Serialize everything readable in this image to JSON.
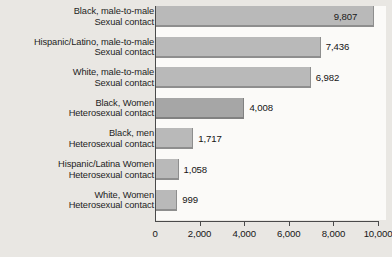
{
  "chart_data": {
    "type": "bar",
    "orientation": "horizontal",
    "title": "",
    "subtitle": "",
    "xlabel": "",
    "ylabel": "",
    "xlim": [
      0,
      10000
    ],
    "xticks": [
      0,
      2000,
      4000,
      6000,
      8000,
      10000
    ],
    "xtick_labels": [
      "0",
      "2,000",
      "4,000",
      "6,000",
      "8,000",
      "10,000"
    ],
    "grid": false,
    "legend": null,
    "categories": [
      "Black, male-to-male Sexual contact",
      "Hispanic/Latino, male-to-male Sexual contact",
      "White, male-to-male Sexual contact",
      "Black, Women Heterosexual contact",
      "Black, men Heterosexual contact",
      "Hispanic/Latina Women Heterosexual contact",
      "White, Women Heterosexual contact"
    ],
    "values": [
      9807,
      7436,
      6982,
      4008,
      1717,
      1058,
      999
    ],
    "value_labels": [
      "9,807",
      "7,436",
      "6,982",
      "4,008",
      "1,717",
      "1,058",
      "999"
    ],
    "bars": [
      {
        "label_line1": "Black, male-to-male",
        "label_line2": "Sexual contact",
        "value": 9807,
        "value_label": "9,807",
        "label_position": "inside",
        "shade": "light"
      },
      {
        "label_line1": "Hispanic/Latino, male-to-male",
        "label_line2": "Sexual contact",
        "value": 7436,
        "value_label": "7,436",
        "label_position": "outside",
        "shade": "light"
      },
      {
        "label_line1": "White, male-to-male",
        "label_line2": "Sexual contact",
        "value": 6982,
        "value_label": "6,982",
        "label_position": "outside",
        "shade": "light"
      },
      {
        "label_line1": "Black, Women",
        "label_line2": "Heterosexual contact",
        "value": 4008,
        "value_label": "4,008",
        "label_position": "outside",
        "shade": "dark"
      },
      {
        "label_line1": "Black, men",
        "label_line2": "Heterosexual contact",
        "value": 1717,
        "value_label": "1,717",
        "label_position": "outside",
        "shade": "light"
      },
      {
        "label_line1": "Hispanic/Latina Women",
        "label_line2": "Heterosexual contact",
        "value": 1058,
        "value_label": "1,058",
        "label_position": "outside",
        "shade": "light"
      },
      {
        "label_line1": "White, Women",
        "label_line2": "Heterosexual contact",
        "value": 999,
        "value_label": "999",
        "label_position": "outside",
        "shade": "light"
      }
    ],
    "colors": {
      "bar_light": "#b9b9b9",
      "bar_dark": "#a6a6a6",
      "bar_edge": "#8e8e8e",
      "axis": "#4a4a4a",
      "background": "#e9e7e3",
      "plot_background": "#fbfaf8",
      "text": "#1d1d1d"
    }
  }
}
